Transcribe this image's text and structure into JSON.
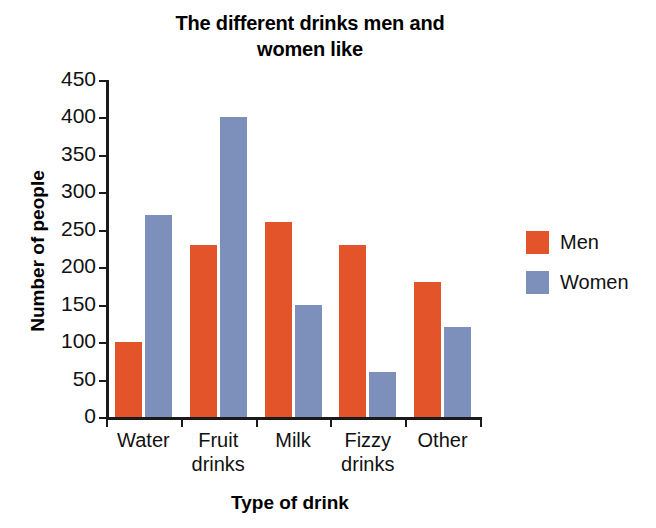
{
  "chart_data": {
    "type": "bar",
    "title": "The different drinks men and\nwomen like",
    "title_line1": "The different drinks men and",
    "title_line2": "women like",
    "xlabel": "Type of drink",
    "ylabel": "Number of people",
    "categories": [
      "Water",
      "Fruit\ndrinks",
      "Milk",
      "Fizzy\ndrinks",
      "Other"
    ],
    "category_names": [
      "Water",
      "Fruit drinks",
      "Milk",
      "Fizzy drinks",
      "Other"
    ],
    "series": [
      {
        "name": "Men",
        "color": "#e4542a",
        "values": [
          100,
          230,
          260,
          230,
          180
        ]
      },
      {
        "name": "Women",
        "color": "#7d8fbb",
        "values": [
          270,
          400,
          150,
          60,
          120
        ]
      }
    ],
    "ylim": [
      0,
      450
    ],
    "ytick_values": [
      0,
      50,
      100,
      150,
      200,
      250,
      300,
      350,
      400,
      450
    ],
    "ytick_labels": [
      "0",
      "50",
      "100",
      "150",
      "200",
      "250",
      "300",
      "350",
      "400",
      "450"
    ],
    "grid": false,
    "legend_position": "right",
    "legend_entries": [
      "Men",
      "Women"
    ]
  },
  "colors": {
    "men": "#e4542a",
    "women": "#7d8fbb",
    "axis": "#1a1a1a",
    "text": "#111111",
    "background": "#ffffff"
  }
}
